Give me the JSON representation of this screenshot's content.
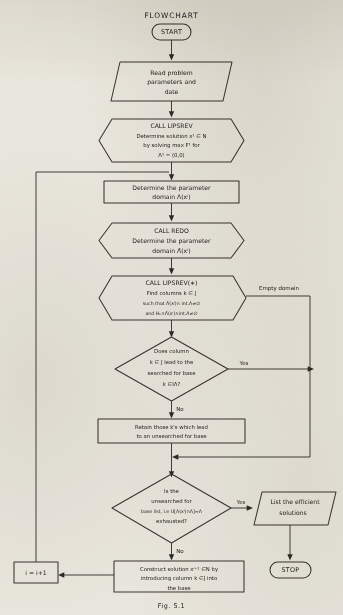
{
  "title": "FLOWCHART",
  "caption": "Fig. 5.1",
  "colors": {
    "paper": "#e9e6dd",
    "ink": "#2b2723",
    "stroke": "#3a3531"
  },
  "nodes": {
    "start": {
      "label": "START",
      "shape": "terminator"
    },
    "read_input": {
      "shape": "parallelogram",
      "lines": [
        "Read problem",
        "parameters and",
        "date"
      ]
    },
    "call_lipsrev": {
      "shape": "hexagon",
      "lines": [
        "CALL LIPSREV",
        "Determine solution  x¹ ∈ N",
        "by  solving   max F¹ for",
        "Λ¹ = (0,0)"
      ]
    },
    "determine_domain": {
      "shape": "process",
      "lines": [
        "Determine the parameter",
        "domain Λ(xⁱ)"
      ]
    },
    "call_redo": {
      "shape": "hexagon",
      "lines": [
        "CALL REDO",
        "Determine the parameter",
        "domain Λ̄(xⁱ)"
      ]
    },
    "call_lipsrev_star": {
      "shape": "hexagon",
      "lines": [
        "CALL LIPSREV(∗)",
        "Find  columns   k ∈ J",
        "such that Λ̄(xⁱ)∩ int.Λ≠∅",
        "and Hₖ∩Λ̄(xⁱ)∩int.Λ≠∅"
      ]
    },
    "decision_column": {
      "shape": "diamond",
      "lines": [
        "Does column",
        "k ∈ J lead to the",
        "searched for base",
        "k ∈IΛ?"
      ]
    },
    "retain": {
      "shape": "process",
      "lines": [
        "Retain those k's  which lead",
        "to an unsearched for  base"
      ]
    },
    "decision_exhausted": {
      "shape": "diamond",
      "lines": [
        "Is the",
        "unsearched for",
        "base list, i.e U[Λ(xⁱ)∩Λ]=Λ",
        "exhausted?"
      ]
    },
    "list_efficient": {
      "shape": "parallelogram",
      "lines": [
        "List the efficient",
        "solutions"
      ]
    },
    "stop": {
      "label": "STOP",
      "shape": "terminator"
    },
    "construct": {
      "shape": "process",
      "lines": [
        "Construct solution xⁱ⁺¹ ∈N by",
        "introducing column  k ∈J into",
        "the base"
      ]
    },
    "increment": {
      "shape": "process",
      "lines": [
        "i = i+1"
      ]
    }
  },
  "edge_labels": {
    "empty_domain": "Empty domain",
    "yes_column": "Yes",
    "no_column": "No",
    "yes_exhausted": "Yes",
    "no_exhausted": "No"
  }
}
